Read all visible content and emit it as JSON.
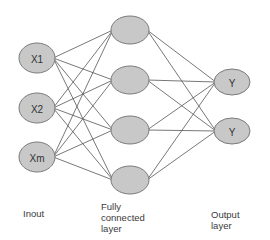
{
  "diagram": {
    "colors": {
      "node_fill": "#c8c8c8",
      "node_stroke": "#7a7a7a",
      "edge": "#555555",
      "text": "#333333"
    },
    "layers": [
      {
        "id": "input",
        "label_lines": [
          "Inout"
        ],
        "nodes": [
          {
            "id": "x1",
            "label": "X1",
            "cx": 37,
            "cy": 58
          },
          {
            "id": "x2",
            "label": "X2",
            "cx": 37,
            "cy": 108
          },
          {
            "id": "xm",
            "label": "Xm",
            "cx": 37,
            "cy": 157
          }
        ]
      },
      {
        "id": "hidden",
        "label_lines": [
          "Fully",
          "connected",
          "layer"
        ],
        "nodes": [
          {
            "id": "h1",
            "label": "",
            "cx": 130,
            "cy": 30
          },
          {
            "id": "h2",
            "label": "",
            "cx": 130,
            "cy": 80
          },
          {
            "id": "h3",
            "label": "",
            "cx": 130,
            "cy": 130
          },
          {
            "id": "h4",
            "label": "",
            "cx": 130,
            "cy": 180
          }
        ]
      },
      {
        "id": "output",
        "label_lines": [
          "Output",
          "layer"
        ],
        "nodes": [
          {
            "id": "y1",
            "label": "Y",
            "cx": 232,
            "cy": 82
          },
          {
            "id": "y2",
            "label": "Y",
            "cx": 232,
            "cy": 131
          }
        ]
      }
    ]
  },
  "labels": {
    "input": {
      "line1": "Inout"
    },
    "hidden": {
      "line1": "Fully",
      "line2": "connected",
      "line3": "layer"
    },
    "output": {
      "line1": "Output",
      "line2": "layer"
    }
  }
}
